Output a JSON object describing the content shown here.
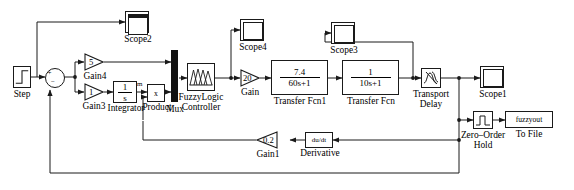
{
  "diagram": {
    "tool": "Simulink",
    "line_color": "#1a1a1a",
    "block_fill": "#ffffff",
    "mux_color": "#111111"
  },
  "blocks": {
    "step": {
      "label": "Step",
      "icon": "step-input-icon"
    },
    "sum": {
      "label": "",
      "icon": "sum-junction-icon",
      "plus": "+",
      "minus": "−"
    },
    "gain4": {
      "label": "Gain4",
      "value": "5",
      "icon": "triangle-gain-icon"
    },
    "gain3": {
      "label": "Gain3",
      "value": "1",
      "icon": "triangle-gain-icon"
    },
    "integrator": {
      "label": "Integrator",
      "num": "1",
      "den": "s",
      "port": "m"
    },
    "product": {
      "label": "Product",
      "value": "x"
    },
    "mux": {
      "label": "Mux",
      "icon": "mux-bar-icon"
    },
    "fuzzy": {
      "label_line1": "FuzzyLogic",
      "label_line2": "Controller",
      "icon": "membership-function-icon"
    },
    "gain": {
      "label": "Gain",
      "value": "20",
      "icon": "triangle-gain-icon"
    },
    "tf1": {
      "label": "Transfer Fcn1",
      "num": "7.4",
      "den": "60s+1"
    },
    "tf2": {
      "label": "Transfer Fcn",
      "num": "1",
      "den": "10s+1"
    },
    "transport_delay": {
      "label_line1": "Transport",
      "label_line2": "Delay",
      "icon": "transport-delay-icon"
    },
    "scope1": {
      "label": "Scope1",
      "icon": "scope-icon"
    },
    "scope2": {
      "label": "Scope2",
      "icon": "scope-icon"
    },
    "scope3": {
      "label": "Scope3",
      "icon": "scope-icon"
    },
    "scope4": {
      "label": "Scope4",
      "icon": "scope-icon"
    },
    "zoh": {
      "label_line1": "Zero–Order",
      "label_line2": "Hold",
      "icon": "zero-order-hold-icon"
    },
    "tofile": {
      "label": "To File",
      "value": "fuzzyout"
    },
    "derivative": {
      "label": "Derivative",
      "value": "du/dt"
    },
    "gain1": {
      "label": "Gain1",
      "value": "0.2",
      "icon": "triangle-gain-icon"
    }
  }
}
